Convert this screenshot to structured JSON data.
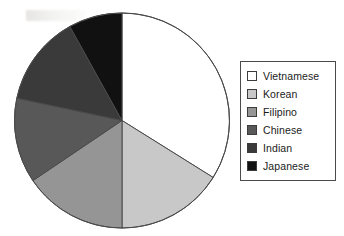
{
  "chart_data": {
    "type": "pie",
    "title": "",
    "categories": [
      "Vietnamese",
      "Korean",
      "Filipino",
      "Chinese",
      "Indian",
      "Japanese"
    ],
    "values": [
      34,
      16,
      15.5,
      13,
      13.5,
      8
    ],
    "units": "percent",
    "start_angle_deg": 0,
    "direction": "clockwise",
    "legend_position": "right",
    "grid": false,
    "slice_colors": [
      "#ffffff",
      "#c8c8c8",
      "#959595",
      "#585858",
      "#3a3a3a",
      "#111111"
    ],
    "slice_boundaries_deg": [
      0,
      122,
      180,
      236,
      282,
      331,
      360
    ],
    "outline_color": "#4a4a4a"
  },
  "legend": {
    "items": [
      {
        "label": "Vietnamese",
        "color": "#ffffff"
      },
      {
        "label": "Korean",
        "color": "#c8c8c8"
      },
      {
        "label": "Filipino",
        "color": "#959595"
      },
      {
        "label": "Chinese",
        "color": "#585858"
      },
      {
        "label": "Indian",
        "color": "#3a3a3a"
      },
      {
        "label": "Japanese",
        "color": "#111111"
      }
    ]
  }
}
